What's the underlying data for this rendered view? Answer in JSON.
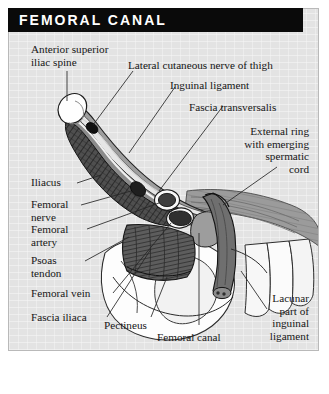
{
  "figure": {
    "title": "FEMORAL CANAL",
    "background_color": "#e3e3e3",
    "title_bar_color": "#0a0a0a",
    "title_text_color": "#ffffff",
    "border_color": "#b9b9b9"
  },
  "labels": {
    "anterior_superior_iliac_spine": "Anterior superior\niliac spine",
    "lateral_cutaneous_nerve": "Lateral cutaneous nerve of thigh",
    "inguinal_ligament": "Inguinal ligament",
    "fascia_transversalis": "Fascia transversalis",
    "external_ring": "External ring\nwith emerging\nspermatic\ncord",
    "iliacus": "Iliacus",
    "femoral_nerve": "Femoral\nnerve",
    "femoral_artery": "Femoral\nartery",
    "psoas_tendon": "Psoas\ntendon",
    "femoral_vein": "Femoral vein",
    "fascia_iliaca": "Fascia iliaca",
    "pectineus": "Pectineus",
    "femoral_canal": "Femoral canal",
    "lacunar_part": "Lacunar\npart of\ninguinal\nligament"
  },
  "anatomy_colors": {
    "bone_white": "#fdfdfd",
    "muscle_dark": "#4a4a4a",
    "muscle_hatch": "#2b2b2b",
    "fascia_grey": "#8e8e8e",
    "fascia_light": "#b5b5b5",
    "vessel_dark": "#3a3a3a",
    "vessel_ring": "#f5f5f5",
    "canal_grey": "#9a9a9a",
    "cord_grey": "#6e6e6e",
    "outline": "#1a1a1a",
    "leader_line": "#2a2a2a"
  }
}
